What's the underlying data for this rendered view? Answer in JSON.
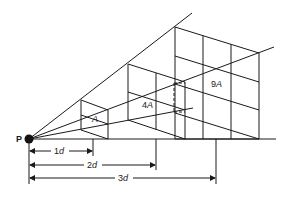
{
  "diagram": {
    "source_label": "P",
    "areas": [
      {
        "label_num": "",
        "label_var": "A",
        "distance": "1d"
      },
      {
        "label_num": "4",
        "label_var": "A",
        "distance": "2d"
      },
      {
        "label_num": "9",
        "label_var": "A",
        "distance": "3d"
      }
    ],
    "dimensions": [
      {
        "num": "1",
        "var": "d"
      },
      {
        "num": "2",
        "var": "d"
      },
      {
        "num": "3",
        "var": "d"
      }
    ],
    "colors": {
      "line": "#1a1a1a",
      "background": "#ffffff"
    }
  }
}
